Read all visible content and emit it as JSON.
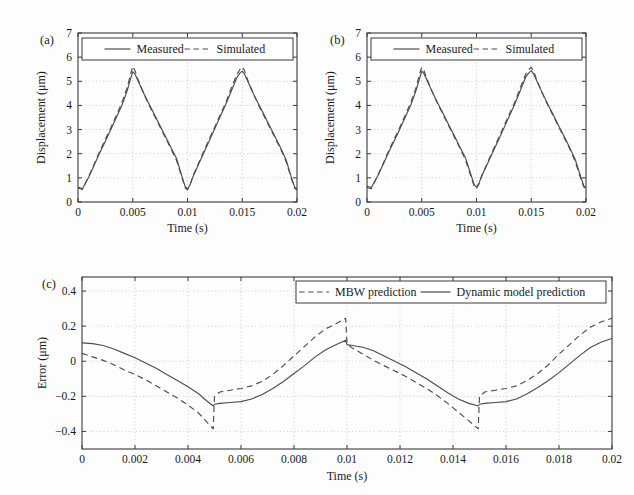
{
  "figure": {
    "background_color": "#fdfdfd",
    "line_color": "#4d4d4d",
    "axis_color": "#3a3a3a",
    "grid_color": "#b8b8b8"
  },
  "panels": [
    {
      "tag": "(a)",
      "legend_entries": [
        {
          "label": "Measured",
          "style": "solid"
        },
        {
          "label": "Simulated",
          "style": "dashed"
        }
      ]
    },
    {
      "tag": "(b)",
      "legend_entries": [
        {
          "label": "Measured",
          "style": "solid"
        },
        {
          "label": "Simulated",
          "style": "dashed"
        }
      ]
    },
    {
      "tag": "(c)",
      "legend_entries": [
        {
          "label": "MBW prediction",
          "style": "dashed"
        },
        {
          "label": "Dynamic model prediction",
          "style": "solid"
        }
      ]
    }
  ],
  "chart_data": [
    {
      "id": "panel-a",
      "type": "line",
      "title": "",
      "panel_label": "(a)",
      "xlabel": "Time (s)",
      "ylabel": "Displacement (μm)",
      "xlim": [
        0,
        0.02
      ],
      "ylim": [
        0,
        7
      ],
      "xticks": [
        0,
        0.005,
        0.01,
        0.015,
        0.02
      ],
      "xticklabels": [
        "0",
        "0.005",
        "0.01",
        "0.015",
        "0.02"
      ],
      "yticks": [
        0,
        1,
        2,
        3,
        4,
        5,
        6,
        7
      ],
      "yticklabels": [
        "0",
        "1",
        "2",
        "3",
        "4",
        "5",
        "6",
        "7"
      ],
      "grid": true,
      "legend_position": "top-center",
      "series": [
        {
          "name": "Measured",
          "style": "solid",
          "x": [
            0,
            0.0004,
            0.001,
            0.0015,
            0.002,
            0.0025,
            0.003,
            0.0035,
            0.004,
            0.0045,
            0.0048,
            0.005,
            0.0052,
            0.0055,
            0.006,
            0.0065,
            0.007,
            0.0075,
            0.008,
            0.0085,
            0.009,
            0.0095,
            0.0098,
            0.01,
            0.0102,
            0.0105,
            0.011,
            0.0115,
            0.012,
            0.0125,
            0.013,
            0.0135,
            0.014,
            0.0145,
            0.0148,
            0.015,
            0.0152,
            0.0155,
            0.016,
            0.0165,
            0.017,
            0.0175,
            0.018,
            0.0185,
            0.019,
            0.0195,
            0.0198,
            0.02
          ],
          "y": [
            0.62,
            0.55,
            1.05,
            1.55,
            2.05,
            2.52,
            3.0,
            3.5,
            4.0,
            4.62,
            5.1,
            5.4,
            5.3,
            5.0,
            4.5,
            4.05,
            3.6,
            3.15,
            2.7,
            2.25,
            1.8,
            1.05,
            0.62,
            0.55,
            0.68,
            1.05,
            1.55,
            2.05,
            2.55,
            3.05,
            3.55,
            4.05,
            4.6,
            5.15,
            5.35,
            5.42,
            5.3,
            5.0,
            4.5,
            4.05,
            3.6,
            3.15,
            2.7,
            2.25,
            1.75,
            1.0,
            0.6,
            0.55
          ]
        },
        {
          "name": "Simulated",
          "style": "dashed",
          "x": [
            0,
            0.0004,
            0.001,
            0.0015,
            0.002,
            0.0025,
            0.003,
            0.0035,
            0.004,
            0.0045,
            0.0048,
            0.005,
            0.0052,
            0.0055,
            0.006,
            0.0065,
            0.007,
            0.0075,
            0.008,
            0.0085,
            0.009,
            0.0095,
            0.0098,
            0.01,
            0.0102,
            0.0105,
            0.011,
            0.0115,
            0.012,
            0.0125,
            0.013,
            0.0135,
            0.014,
            0.0145,
            0.0148,
            0.015,
            0.0152,
            0.0155,
            0.016,
            0.0165,
            0.017,
            0.0175,
            0.018,
            0.0185,
            0.019,
            0.0195,
            0.0198,
            0.02
          ],
          "y": [
            0.58,
            0.52,
            1.08,
            1.6,
            2.12,
            2.6,
            3.08,
            3.58,
            4.1,
            4.75,
            5.3,
            5.62,
            5.45,
            5.05,
            4.5,
            4.0,
            3.55,
            3.1,
            2.65,
            2.2,
            1.72,
            1.0,
            0.58,
            0.5,
            0.66,
            1.08,
            1.6,
            2.12,
            2.62,
            3.12,
            3.62,
            4.12,
            4.72,
            5.28,
            5.5,
            5.6,
            5.45,
            5.05,
            4.5,
            4.0,
            3.55,
            3.1,
            2.65,
            2.2,
            1.68,
            0.95,
            0.56,
            0.5
          ]
        }
      ]
    },
    {
      "id": "panel-b",
      "type": "line",
      "title": "",
      "panel_label": "(b)",
      "xlabel": "Time (s)",
      "ylabel": "Displacement (μm)",
      "xlim": [
        0,
        0.02
      ],
      "ylim": [
        0,
        7
      ],
      "xticks": [
        0,
        0.005,
        0.01,
        0.015,
        0.02
      ],
      "xticklabels": [
        "0",
        "0.005",
        "0.01",
        "0.015",
        "0.02"
      ],
      "yticks": [
        0,
        1,
        2,
        3,
        4,
        5,
        6,
        7
      ],
      "yticklabels": [
        "0",
        "1",
        "2",
        "3",
        "4",
        "5",
        "6",
        "7"
      ],
      "grid": true,
      "legend_position": "top-center",
      "series": [
        {
          "name": "Measured",
          "style": "solid",
          "x": [
            0,
            0.0004,
            0.001,
            0.0015,
            0.002,
            0.0025,
            0.003,
            0.0035,
            0.004,
            0.0045,
            0.0048,
            0.005,
            0.0052,
            0.0055,
            0.006,
            0.0065,
            0.007,
            0.0075,
            0.008,
            0.0085,
            0.009,
            0.0095,
            0.0098,
            0.01,
            0.0102,
            0.0105,
            0.011,
            0.0115,
            0.012,
            0.0125,
            0.013,
            0.0135,
            0.014,
            0.0145,
            0.0148,
            0.015,
            0.0152,
            0.0155,
            0.016,
            0.0165,
            0.017,
            0.0175,
            0.018,
            0.0185,
            0.019,
            0.0195,
            0.0198,
            0.02
          ],
          "y": [
            0.65,
            0.6,
            1.1,
            1.58,
            2.08,
            2.55,
            3.02,
            3.52,
            4.02,
            4.65,
            5.12,
            5.42,
            5.32,
            5.02,
            4.52,
            4.06,
            3.62,
            3.16,
            2.72,
            2.26,
            1.82,
            1.12,
            0.7,
            0.62,
            0.75,
            1.1,
            1.58,
            2.08,
            2.56,
            3.06,
            3.56,
            4.06,
            4.62,
            5.18,
            5.36,
            5.44,
            5.32,
            5.02,
            4.52,
            4.06,
            3.62,
            3.16,
            2.72,
            2.26,
            1.78,
            1.08,
            0.66,
            0.62
          ]
        },
        {
          "name": "Simulated",
          "style": "dashed",
          "x": [
            0,
            0.0004,
            0.001,
            0.0015,
            0.002,
            0.0025,
            0.003,
            0.0035,
            0.004,
            0.0045,
            0.0048,
            0.005,
            0.0052,
            0.0055,
            0.006,
            0.0065,
            0.007,
            0.0075,
            0.008,
            0.0085,
            0.009,
            0.0095,
            0.0098,
            0.01,
            0.0102,
            0.0105,
            0.011,
            0.0115,
            0.012,
            0.0125,
            0.013,
            0.0135,
            0.014,
            0.0145,
            0.0148,
            0.015,
            0.0152,
            0.0155,
            0.016,
            0.0165,
            0.017,
            0.0175,
            0.018,
            0.0185,
            0.019,
            0.0195,
            0.0198,
            0.02
          ],
          "y": [
            0.6,
            0.55,
            1.12,
            1.62,
            2.14,
            2.62,
            3.1,
            3.6,
            4.12,
            4.76,
            5.3,
            5.58,
            5.44,
            5.06,
            4.52,
            4.02,
            3.57,
            3.12,
            2.67,
            2.22,
            1.74,
            1.05,
            0.64,
            0.56,
            0.72,
            1.12,
            1.62,
            2.14,
            2.64,
            3.14,
            3.64,
            4.14,
            4.74,
            5.3,
            5.5,
            5.58,
            5.44,
            5.06,
            4.52,
            4.02,
            3.57,
            3.12,
            2.67,
            2.22,
            1.7,
            1.0,
            0.62,
            0.56
          ]
        }
      ]
    },
    {
      "id": "panel-c",
      "type": "line",
      "title": "",
      "panel_label": "(c)",
      "xlabel": "Time (s)",
      "ylabel": "Error (μm)",
      "xlim": [
        0,
        0.02
      ],
      "ylim": [
        -0.5,
        0.48
      ],
      "xticks": [
        0,
        0.002,
        0.004,
        0.006,
        0.008,
        0.01,
        0.012,
        0.014,
        0.016,
        0.018,
        0.02
      ],
      "xticklabels": [
        "0",
        "0.002",
        "0.004",
        "0.006",
        "0.008",
        "0.01",
        "0.012",
        "0.014",
        "0.016",
        "0.018",
        "0.02"
      ],
      "yticks": [
        -0.4,
        -0.2,
        0,
        0.2,
        0.4
      ],
      "yticklabels": [
        "−0.4",
        "−0.2",
        "0",
        "0.2",
        "0.4"
      ],
      "grid": true,
      "legend_position": "top-right",
      "series": [
        {
          "name": "MBW prediction",
          "style": "dashed",
          "x": [
            0,
            0.0004,
            0.0008,
            0.0012,
            0.0016,
            0.002,
            0.0024,
            0.0028,
            0.0032,
            0.0036,
            0.004,
            0.0044,
            0.0047,
            0.00495,
            0.005,
            0.0052,
            0.0056,
            0.006,
            0.0064,
            0.0068,
            0.0072,
            0.0076,
            0.008,
            0.0084,
            0.0088,
            0.0092,
            0.0096,
            0.00995,
            0.01,
            0.0102,
            0.0106,
            0.011,
            0.0114,
            0.0118,
            0.0122,
            0.0126,
            0.013,
            0.0134,
            0.0138,
            0.0142,
            0.0146,
            0.01495,
            0.015,
            0.0152,
            0.0156,
            0.016,
            0.0164,
            0.0168,
            0.0172,
            0.0176,
            0.018,
            0.0184,
            0.0188,
            0.0192,
            0.0196,
            0.02
          ],
          "y": [
            0.045,
            0.025,
            0.005,
            -0.02,
            -0.05,
            -0.075,
            -0.105,
            -0.14,
            -0.175,
            -0.21,
            -0.25,
            -0.295,
            -0.345,
            -0.385,
            -0.2,
            -0.175,
            -0.165,
            -0.155,
            -0.14,
            -0.115,
            -0.075,
            -0.025,
            0.03,
            0.085,
            0.14,
            0.185,
            0.215,
            0.245,
            0.1,
            0.075,
            0.04,
            0.005,
            -0.025,
            -0.055,
            -0.085,
            -0.12,
            -0.155,
            -0.195,
            -0.24,
            -0.29,
            -0.34,
            -0.385,
            -0.2,
            -0.175,
            -0.165,
            -0.155,
            -0.14,
            -0.11,
            -0.07,
            -0.02,
            0.04,
            0.095,
            0.15,
            0.195,
            0.225,
            0.245
          ]
        },
        {
          "name": "Dynamic model prediction",
          "style": "solid",
          "x": [
            0,
            0.0004,
            0.0008,
            0.0012,
            0.0016,
            0.002,
            0.0024,
            0.0028,
            0.0032,
            0.0036,
            0.004,
            0.0044,
            0.0047,
            0.00495,
            0.005,
            0.0052,
            0.0056,
            0.006,
            0.0064,
            0.0068,
            0.0072,
            0.0076,
            0.008,
            0.0084,
            0.0088,
            0.0092,
            0.0096,
            0.00995,
            0.01,
            0.0102,
            0.0106,
            0.011,
            0.0114,
            0.0118,
            0.0122,
            0.0126,
            0.013,
            0.0134,
            0.0138,
            0.0142,
            0.0146,
            0.01495,
            0.015,
            0.0152,
            0.0156,
            0.016,
            0.0164,
            0.0168,
            0.0172,
            0.0176,
            0.018,
            0.0184,
            0.0188,
            0.0192,
            0.0196,
            0.02
          ],
          "y": [
            0.105,
            0.1,
            0.09,
            0.07,
            0.045,
            0.02,
            -0.01,
            -0.04,
            -0.075,
            -0.11,
            -0.145,
            -0.185,
            -0.225,
            -0.255,
            -0.245,
            -0.24,
            -0.235,
            -0.23,
            -0.215,
            -0.19,
            -0.155,
            -0.115,
            -0.07,
            -0.025,
            0.025,
            0.065,
            0.095,
            0.12,
            0.095,
            0.09,
            0.08,
            0.06,
            0.03,
            0.0,
            -0.03,
            -0.065,
            -0.1,
            -0.14,
            -0.18,
            -0.215,
            -0.24,
            -0.255,
            -0.245,
            -0.24,
            -0.235,
            -0.23,
            -0.215,
            -0.185,
            -0.15,
            -0.11,
            -0.065,
            -0.015,
            0.035,
            0.08,
            0.11,
            0.13
          ]
        }
      ]
    }
  ]
}
